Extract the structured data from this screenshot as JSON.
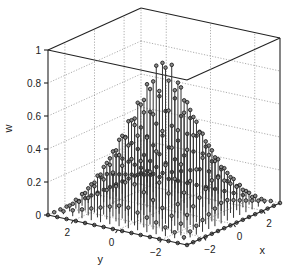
{
  "chart_data": {
    "type": "stem3",
    "title": "",
    "xlabel": "x",
    "ylabel": "y",
    "zlabel": "w",
    "xlim": [
      -3.1416,
      3.1416
    ],
    "ylim": [
      -3.1416,
      3.1416
    ],
    "zlim": [
      0,
      1
    ],
    "xticks": [
      -2,
      0,
      2
    ],
    "yticks": [
      -2,
      0,
      2
    ],
    "zticks": [
      0,
      0.2,
      0.4,
      0.6,
      0.8,
      1
    ],
    "xtick_labels": [
      "−2",
      "0",
      "2"
    ],
    "ytick_labels": [
      "−2",
      "0",
      "2"
    ],
    "ztick_labels": [
      "0",
      "0.2",
      "0.4",
      "0.6",
      "0.8",
      "1"
    ],
    "grid": true,
    "box": true,
    "grid_points_per_axis": 16,
    "function": "w = (1 - |x|/pi) * (1 - |y|/pi)",
    "peak_value": 0.95,
    "marker": "circle",
    "color": "#333333"
  },
  "projection": {
    "front": [
      187,
      245
    ],
    "left": [
      48,
      215
    ],
    "right": [
      280,
      203
    ],
    "z_pixels_per_unit": 165
  }
}
